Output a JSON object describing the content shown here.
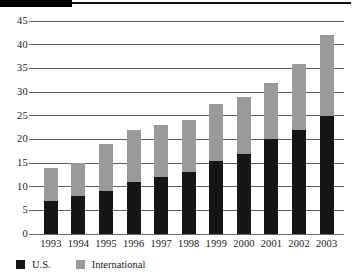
{
  "figure": {
    "header_band": {
      "block_color": "#000000",
      "rule_color": "#111111"
    }
  },
  "chart_data": {
    "type": "bar",
    "stacked": true,
    "title": "",
    "subtitle": "",
    "xlabel": "",
    "ylabel": "",
    "categories": [
      "1993",
      "1994",
      "1995",
      "1996",
      "1997",
      "1998",
      "1999",
      "2000",
      "2001",
      "2002",
      "2003"
    ],
    "series": [
      {
        "name": "U.S.",
        "color": "#151515",
        "values": [
          7,
          8,
          9,
          11,
          12,
          13,
          15.5,
          17,
          20,
          22,
          25
        ]
      },
      {
        "name": "International",
        "color": "#9a9a9a",
        "values": [
          7,
          7,
          10,
          11,
          11,
          11,
          12,
          12,
          12,
          14,
          17
        ]
      }
    ],
    "totals": [
      14,
      15,
      19,
      22,
      23,
      24,
      27.5,
      29,
      32,
      36,
      42
    ],
    "ylim": [
      0,
      45
    ],
    "ytick_values": [
      0,
      5,
      10,
      15,
      20,
      25,
      30,
      35,
      40,
      45
    ],
    "ytick_labels": [
      "0",
      "5",
      "10",
      "15",
      "20",
      "25",
      "30",
      "35",
      "40",
      "45"
    ],
    "grid": true,
    "grid_color": "#5f5f5f",
    "legend_position": "bottom-left",
    "legend": [
      {
        "label": "U.S.",
        "color": "#151515"
      },
      {
        "label": "International",
        "color": "#9a9a9a"
      }
    ]
  }
}
